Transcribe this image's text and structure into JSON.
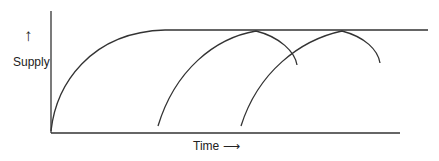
{
  "diagram": {
    "y_axis": {
      "label": "Supply",
      "arrow": "↑"
    },
    "x_axis": {
      "label": "Time ⟶"
    },
    "stroke_color": "#333333",
    "curves": [
      {
        "name": "initial-supply-curve",
        "description": "rises from origin and plateaus at maximum supply"
      },
      {
        "name": "second-supply-curve",
        "description": "later arc that crosses the plateau then declines"
      },
      {
        "name": "third-supply-curve",
        "description": "latest arc that crosses the plateau then declines"
      }
    ]
  }
}
